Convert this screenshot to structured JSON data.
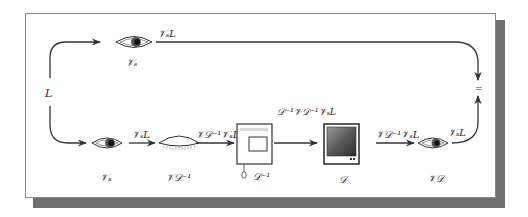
{
  "diagram": {
    "input_label": "L",
    "top_path": {
      "observer_label": "𝒱ₛ",
      "output_label": "𝒱ₛL"
    },
    "bottom_path": {
      "observer_label": "𝒱ₛ",
      "arrow1_label": "𝒱ₛL",
      "adaptation_label": "𝒱𝒟⁻¹",
      "arrow2_label": "𝒱𝒟⁻¹𝒱ₛL",
      "device_inverse_label": "𝒟⁻¹",
      "arrow3_label": "𝒟⁻¹𝒱𝒟⁻¹𝒱ₛL",
      "display_label": "𝒟",
      "arrow4_label": "𝒱𝒟⁻¹𝒱ₛL",
      "display_observer_label": "𝒱𝒟",
      "arrow5_label": "𝒱ₛL"
    },
    "equality_symbol": "="
  },
  "colors": {
    "frame_border": "#8a8a8a",
    "shadow": "#6e6e6e",
    "stroke": "#333333"
  }
}
